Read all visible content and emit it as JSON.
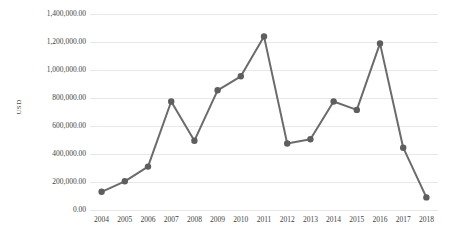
{
  "chart_data": {
    "type": "line",
    "title": "",
    "xlabel": "",
    "ylabel": "USD",
    "categories": [
      "2004",
      "2005",
      "2006",
      "2007",
      "2008",
      "2009",
      "2010",
      "2011",
      "2012",
      "2013",
      "2014",
      "2015",
      "2016",
      "2017",
      "2018"
    ],
    "values": [
      130000,
      205000,
      310000,
      775000,
      495000,
      855000,
      955000,
      1240000,
      475000,
      505000,
      775000,
      715000,
      1190000,
      445000,
      90000
    ],
    "series": [
      {
        "name": "USD",
        "values": [
          130000,
          205000,
          310000,
          775000,
          495000,
          855000,
          955000,
          1240000,
          475000,
          505000,
          775000,
          715000,
          1190000,
          445000,
          90000
        ]
      }
    ],
    "ylim": [
      0,
      1400000
    ],
    "ytick_values": [
      0,
      200000,
      400000,
      600000,
      800000,
      1000000,
      1200000,
      1400000
    ],
    "ytick_labels": [
      "0.00",
      "200,000.00",
      "400,000.00",
      "600,000.00",
      "800,000.00",
      "1,000,000.00",
      "1,200,000.00",
      "1,400,000.00"
    ],
    "grid": true,
    "legend": "none",
    "line_color": "#6b6b6b",
    "marker_color": "#5e5e5e",
    "gridline_color": "#e8e8e8",
    "background_color": "#ffffff",
    "marker": "circle",
    "marker_size": 3.2,
    "line_width": 2
  }
}
